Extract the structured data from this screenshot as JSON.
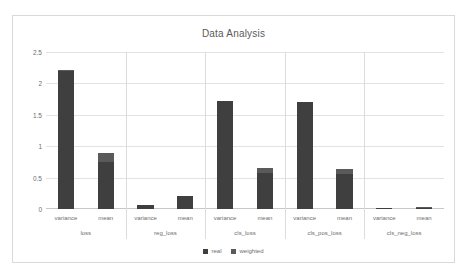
{
  "chart_data": {
    "type": "bar",
    "title": "Data Analysis",
    "xlabel": "",
    "ylabel": "",
    "ylim": [
      0,
      2.5
    ],
    "yticks": [
      "0",
      "0.5",
      "1",
      "1.5",
      "2",
      "2.5"
    ],
    "grid": true,
    "legend_position": "bottom",
    "legend": [
      "real",
      "weighted"
    ],
    "groups": [
      "loss",
      "reg_loss",
      "cls_loss",
      "cls_pos_loss",
      "cls_neg_loss"
    ],
    "subcategories": [
      "variance",
      "mean"
    ],
    "categories": [
      "loss / variance",
      "loss / mean",
      "reg_loss / variance",
      "reg_loss / mean",
      "cls_loss / variance",
      "cls_loss / mean",
      "cls_pos_loss / variance",
      "cls_pos_loss / mean",
      "cls_neg_loss / variance",
      "cls_neg_loss / mean"
    ],
    "series": [
      {
        "name": "real",
        "color": "#3f3f3f",
        "values": [
          2.19,
          0.75,
          0.07,
          0.2,
          1.72,
          0.57,
          1.71,
          0.56,
          0.01,
          0.02
        ]
      },
      {
        "name": "weighted",
        "color": "#5a5a5a",
        "values": [
          2.21,
          0.89,
          0.07,
          0.21,
          1.72,
          0.65,
          1.71,
          0.63,
          0.01,
          0.03
        ]
      }
    ]
  },
  "chart": {
    "title": "Data Analysis",
    "yticks": [
      {
        "label": "2.5",
        "value": 2.5
      },
      {
        "label": "2",
        "value": 2
      },
      {
        "label": "1.5",
        "value": 1.5
      },
      {
        "label": "1",
        "value": 1
      },
      {
        "label": "0.5",
        "value": 0.5
      },
      {
        "label": "0",
        "value": 0
      }
    ],
    "groups": [
      {
        "name": "loss",
        "bars": [
          {
            "label": "variance",
            "real": 2.19,
            "weighted": 2.21
          },
          {
            "label": "mean",
            "real": 0.75,
            "weighted": 0.89
          }
        ]
      },
      {
        "name": "reg_loss",
        "bars": [
          {
            "label": "variance",
            "real": 0.07,
            "weighted": 0.07
          },
          {
            "label": "mean",
            "real": 0.2,
            "weighted": 0.21
          }
        ]
      },
      {
        "name": "cls_loss",
        "bars": [
          {
            "label": "variance",
            "real": 1.72,
            "weighted": 1.72
          },
          {
            "label": "mean",
            "real": 0.57,
            "weighted": 0.65
          }
        ]
      },
      {
        "name": "cls_pos_loss",
        "bars": [
          {
            "label": "variance",
            "real": 1.71,
            "weighted": 1.71
          },
          {
            "label": "mean",
            "real": 0.56,
            "weighted": 0.63
          }
        ]
      },
      {
        "name": "cls_neg_loss",
        "bars": [
          {
            "label": "variance",
            "real": 0.01,
            "weighted": 0.01
          },
          {
            "label": "mean",
            "real": 0.02,
            "weighted": 0.03
          }
        ]
      }
    ],
    "legend": [
      {
        "label": "real",
        "color": "#3f3f3f"
      },
      {
        "label": "weighted",
        "color": "#5a5a5a"
      }
    ]
  }
}
